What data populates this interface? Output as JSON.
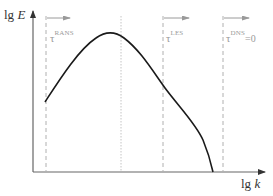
{
  "diagram": {
    "type": "turbulence-energy-spectrum",
    "y_axis": {
      "label_prefix": "lg",
      "label_var": "E"
    },
    "x_axis": {
      "label_prefix": "lg",
      "label_var": "k"
    },
    "regions": [
      {
        "id": "rans",
        "symbol": "τ",
        "superscript": "RANS",
        "suffix": ""
      },
      {
        "id": "les",
        "symbol": "τ",
        "superscript": "LES",
        "suffix": ""
      },
      {
        "id": "dns",
        "symbol": "τ",
        "superscript": "DNS",
        "suffix": "=0"
      }
    ],
    "colors": {
      "axis": "#555555",
      "curve": "#1a1a1a",
      "dashed": "#b0b0b0",
      "dotted": "#c4c4c4",
      "arrow": "#9a9a9a",
      "label": "#9a9a9a"
    }
  }
}
